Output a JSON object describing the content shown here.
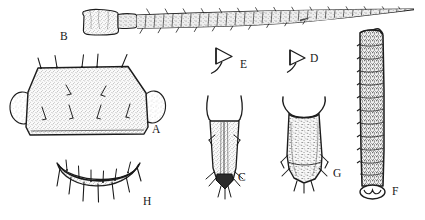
{
  "plate": {
    "title": "Morphological illustration plate",
    "background_color": "#ffffff",
    "ink_color": "#1a1a1a",
    "stipple_color": "#6b6b6b",
    "width": 425,
    "height": 220,
    "clipped_caption": "p g p   p      g   p        g  p      p   g      p"
  },
  "figures": [
    {
      "label": "A",
      "name": "pronotum-or-segment",
      "description": "Large stippled trapezoidal sclerite with dorsal setae and lateral oval lobes",
      "label_x": 152,
      "label_y": 133
    },
    {
      "label": "B",
      "name": "antenna",
      "description": "Elongate multi-segmented antenna with scape, pedicel and tapering flagellum bearing fine setae",
      "label_x": 60,
      "label_y": 40
    },
    {
      "label": "C",
      "name": "ovipositor-or-terminal-appendage",
      "description": "Tapering stippled tube with bifid apex, dark pointed tip and lateral setae",
      "label_x": 238,
      "label_y": 181
    },
    {
      "label": "D",
      "name": "spine-or-sensillum-d",
      "description": "Small triangular arrowhead-shaped spine in outline",
      "label_x": 310,
      "label_y": 62
    },
    {
      "label": "E",
      "name": "spine-or-sensillum-e",
      "description": "Small triangular arrowhead-shaped spine in outline with curved stalk",
      "label_x": 240,
      "label_y": 68
    },
    {
      "label": "F",
      "name": "elongate-segmented-appendage",
      "description": "Long annulated cylindrical segment, densely stippled, with scalloped rounded base",
      "label_x": 392,
      "label_y": 195
    },
    {
      "label": "G",
      "name": "terminal-appendage-g",
      "description": "Densely speckled flask-shaped tube with flared rim and rounded apex with setae",
      "label_x": 333,
      "label_y": 177
    },
    {
      "label": "H",
      "name": "crescent-sclerite",
      "description": "Crescent-shaped stippled band bearing a row of long downward setae",
      "label_x": 143,
      "label_y": 205
    }
  ]
}
